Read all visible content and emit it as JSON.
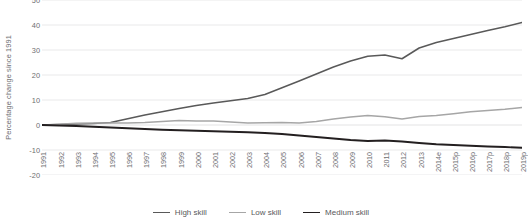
{
  "chart_data": {
    "type": "line",
    "title": "",
    "xlabel": "",
    "ylabel": "Percentage change since 1991",
    "ylim": [
      -20,
      50
    ],
    "yticks": [
      50,
      40,
      30,
      20,
      10,
      0,
      -10,
      -20
    ],
    "grid": true,
    "legend_position": "bottom",
    "categories": [
      "1991",
      "1992",
      "1993",
      "1994",
      "1995",
      "1996",
      "1997",
      "1998",
      "1999",
      "2000",
      "2001",
      "2002",
      "2003",
      "2004",
      "2005",
      "2006",
      "2007",
      "2008",
      "2009",
      "2010",
      "2011",
      "2012",
      "2013",
      "2014e",
      "2015p",
      "2016p",
      "2017p",
      "2018p",
      "2019p"
    ],
    "series": [
      {
        "name": "High skill",
        "color": "#595959",
        "width": 1.5,
        "values": [
          0,
          0.2,
          0.4,
          0.6,
          1.0,
          2.5,
          4.0,
          5.3,
          6.6,
          7.8,
          8.8,
          9.7,
          10.6,
          12.2,
          14.9,
          17.6,
          20.4,
          23.2,
          25.6,
          27.5,
          28.0,
          26.5,
          30.8,
          33.0,
          34.6,
          36.2,
          37.8,
          39.3,
          41.0
        ]
      },
      {
        "name": "Low skill",
        "color": "#a6a6a6",
        "width": 1.3,
        "values": [
          0,
          0.3,
          0.7,
          0.8,
          0.8,
          0.8,
          1.0,
          1.4,
          1.8,
          1.6,
          1.6,
          1.2,
          0.8,
          0.9,
          1.0,
          0.8,
          1.4,
          2.4,
          3.2,
          3.8,
          3.3,
          2.4,
          3.4,
          3.8,
          4.5,
          5.3,
          5.8,
          6.3,
          7.0
        ]
      },
      {
        "name": "Medium skill",
        "color": "#231f20",
        "width": 1.8,
        "values": [
          0,
          -0.2,
          -0.4,
          -0.7,
          -1.0,
          -1.3,
          -1.6,
          -1.9,
          -2.1,
          -2.3,
          -2.5,
          -2.7,
          -2.9,
          -3.2,
          -3.6,
          -4.2,
          -4.8,
          -5.4,
          -6.0,
          -6.4,
          -6.2,
          -6.6,
          -7.2,
          -7.7,
          -8.0,
          -8.3,
          -8.6,
          -8.8,
          -9.1
        ]
      }
    ]
  },
  "legend": {
    "items": [
      {
        "label": "High skill",
        "color": "#595959"
      },
      {
        "label": "Low skill",
        "color": "#a6a6a6"
      },
      {
        "label": "Medium skill",
        "color": "#231f20"
      }
    ]
  },
  "axis": {
    "y_title": "Percentage change since 1991",
    "grid_color": "#e9e9ea",
    "zero_line_color": "#e3e3e4"
  }
}
